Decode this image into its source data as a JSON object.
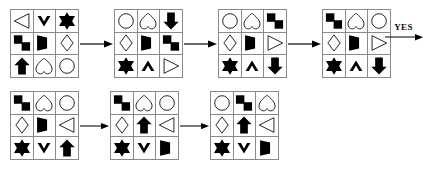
{
  "figure": {
    "type": "shape-sequence-puzzle",
    "stroke_color": "#000000",
    "fill_color": "#000000",
    "grid_line_color": "#8a8a8a",
    "background_color": "#ffffff"
  },
  "terminal": {
    "label": "YES",
    "arrow_icon": "arrow-right-icon"
  },
  "connector": {
    "icon": "arrow-right-icon"
  },
  "sequences": [
    {
      "name": "top-sequence",
      "grids": [
        {
          "name": "grid-top-1",
          "cells": [
            "triangle-left-outline",
            "chevron-down-filled",
            "star-filled",
            "step-filled",
            "dshape-filled",
            "diamond-outline",
            "arrow-up-filled",
            "heart-outline",
            "circle-outline"
          ]
        },
        {
          "name": "grid-top-2",
          "cells": [
            "circle-outline",
            "heart-outline",
            "arrow-down-filled",
            "diamond-outline",
            "dshape-filled",
            "step-filled",
            "star-filled",
            "chevron-up-filled",
            "triangle-right-outline"
          ]
        },
        {
          "name": "grid-top-3",
          "cells": [
            "circle-outline",
            "heart-outline",
            "step-filled",
            "diamond-outline",
            "dshape-filled",
            "triangle-right-outline",
            "star-filled",
            "chevron-up-filled",
            "arrow-down-filled"
          ]
        },
        {
          "name": "grid-top-4",
          "cells": [
            "step-filled",
            "heart-outline",
            "circle-outline",
            "diamond-outline",
            "dshape-filled",
            "triangle-right-outline",
            "star-filled",
            "chevron-up-filled",
            "arrow-down-filled"
          ]
        }
      ]
    },
    {
      "name": "bottom-sequence",
      "grids": [
        {
          "name": "grid-bottom-1",
          "cells": [
            "step-filled",
            "heart-outline",
            "circle-outline",
            "diamond-outline",
            "dshape-filled",
            "triangle-left-outline",
            "star-filled",
            "chevron-down-filled",
            "arrow-up-filled"
          ]
        },
        {
          "name": "grid-bottom-2",
          "cells": [
            "step-filled",
            "heart-outline",
            "circle-outline",
            "diamond-outline",
            "arrow-up-filled",
            "triangle-left-outline",
            "star-filled",
            "chevron-down-filled",
            "dshape-filled"
          ]
        },
        {
          "name": "grid-bottom-3",
          "cells": [
            "circle-outline",
            "step-filled",
            "heart-outline",
            "diamond-outline",
            "arrow-up-filled",
            "triangle-left-outline",
            "star-filled",
            "chevron-down-filled",
            "dshape-filled"
          ]
        }
      ]
    }
  ]
}
